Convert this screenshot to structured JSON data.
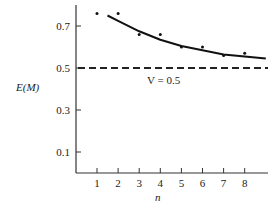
{
  "chart_data": {
    "type": "scatter",
    "title": "",
    "xlabel": "n",
    "ylabel": "E(M)",
    "x_ticks": [
      1,
      2,
      3,
      4,
      5,
      6,
      7,
      8
    ],
    "y_ticks": [
      0.1,
      0.3,
      0.5,
      0.7
    ],
    "y_tick_labels": [
      "0.1",
      "0.3",
      "0.5",
      "0.7"
    ],
    "x_tick_labels": [
      "1",
      "2",
      "3",
      "4",
      "5",
      "6",
      "7",
      "8"
    ],
    "xlim": [
      0,
      9.3
    ],
    "ylim": [
      0,
      0.8
    ],
    "grid": false,
    "legend": "none",
    "series": [
      {
        "name": "observed",
        "style": "points",
        "x": [
          1,
          2,
          3,
          4,
          5,
          6,
          7,
          8
        ],
        "y": [
          0.76,
          0.76,
          0.66,
          0.66,
          0.6,
          0.6,
          0.56,
          0.57
        ]
      },
      {
        "name": "fitted curve",
        "style": "solid-line",
        "x": [
          1.5,
          2,
          3,
          4,
          5,
          6,
          7,
          8,
          9
        ],
        "y": [
          0.75,
          0.725,
          0.675,
          0.635,
          0.605,
          0.585,
          0.565,
          0.555,
          0.545
        ]
      },
      {
        "name": "V = 0.5",
        "style": "dashed-line",
        "x": [
          0,
          9.3
        ],
        "y": [
          0.5,
          0.5
        ]
      }
    ],
    "annotations": [
      {
        "text": "V = 0.5",
        "x": 3.6,
        "y": 0.45
      }
    ]
  },
  "labels": {
    "ylabel": "E(M)",
    "xlabel": "n",
    "annotation": "V = 0.5"
  }
}
